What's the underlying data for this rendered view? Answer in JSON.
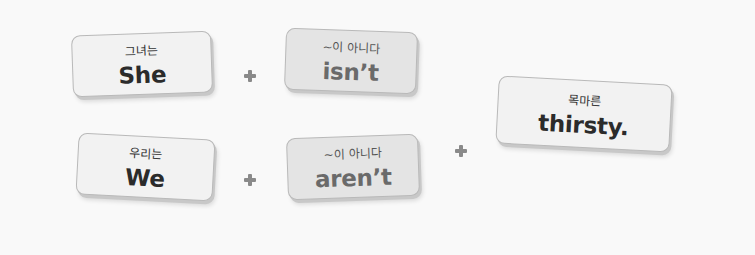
{
  "cards": [
    {
      "ko": "그녀는",
      "en": "She"
    },
    {
      "ko": "~이 아니다",
      "en": "isn’t"
    },
    {
      "ko": "우리는",
      "en": "We"
    },
    {
      "ko": "~이 아니다",
      "en": "aren’t"
    },
    {
      "ko": "목마른",
      "en": "thirsty."
    }
  ],
  "operators": [
    "+",
    "+",
    "+"
  ]
}
